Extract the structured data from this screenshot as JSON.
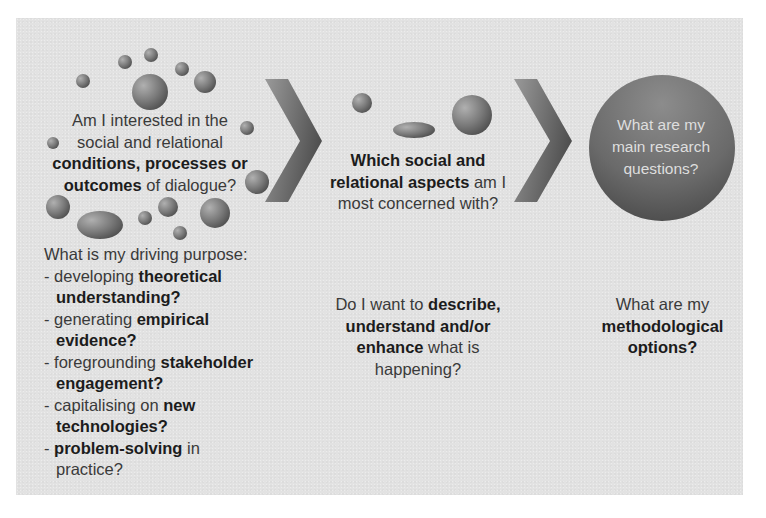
{
  "diagram": {
    "colors": {
      "panel_bg": "#e2e2e2",
      "page_bg": "#ffffff",
      "bubble_light": "#a8a8a8",
      "bubble_dark": "#555555",
      "circle_text": "#dedede",
      "text": "#2a2a2a"
    },
    "step1": {
      "question": {
        "line1": "Am I interested in the",
        "line2": "social and relational",
        "line3_bold": "conditions, processes or",
        "line4_bold": "outcomes",
        "line4_rest": " of dialogue?"
      },
      "purpose": {
        "heading": "What is my driving purpose:",
        "items": [
          {
            "prefix": "- developing ",
            "bold": "theoretical",
            "cont_bold": "understanding?",
            "cont_rest": ""
          },
          {
            "prefix": "- generating ",
            "bold": "empirical",
            "cont_bold": "evidence?",
            "cont_rest": ""
          },
          {
            "prefix": "- foregrounding ",
            "bold": "stakeholder",
            "cont_bold": "engagement?",
            "cont_rest": ""
          },
          {
            "prefix": "- capitalising on ",
            "bold": "new",
            "cont_bold": "technologies?",
            "cont_rest": ""
          },
          {
            "prefix": "- ",
            "bold": "problem-solving",
            "suffix": " in",
            "cont_bold": "",
            "cont_rest": "practice?"
          }
        ]
      }
    },
    "step2": {
      "question": {
        "line1_bold": "Which social and",
        "line2_bold": "relational aspects",
        "line2_rest": " am I",
        "line3": "most concerned with?"
      },
      "approach": {
        "line1": "Do I want to ",
        "line1_bold": "describe,",
        "line2_bold": "understand and/or",
        "line3_bold": "enhance",
        "line3_rest": " what is",
        "line4": "happening?"
      }
    },
    "step3": {
      "circle_text": {
        "line1": "What are my",
        "line2": "main research",
        "line3": "questions?"
      },
      "methods": {
        "line1": "What are my",
        "line2_bold": "methodological",
        "line3_bold": "options?"
      }
    },
    "icons": [
      "bubble-cluster-icon",
      "chevron-right-icon",
      "bubble-cluster-icon",
      "chevron-right-icon",
      "circle-badge-icon"
    ]
  }
}
